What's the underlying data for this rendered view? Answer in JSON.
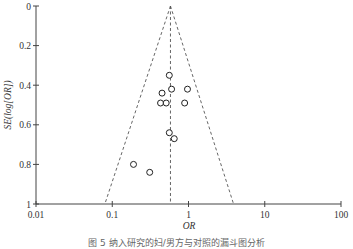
{
  "chart_data": {
    "type": "scatter",
    "subtype": "funnel_plot",
    "title": "",
    "xlabel": "OR",
    "ylabel": "SE(log[OR])",
    "x_scale": "log",
    "xlim": [
      0.01,
      100
    ],
    "ylim": [
      1,
      0
    ],
    "y_inverted": true,
    "x_ticks": [
      "0.01",
      "0.1",
      "1",
      "10",
      "100"
    ],
    "y_ticks": [
      "0",
      "0.2",
      "0.4",
      "0.6",
      "0.8",
      "1"
    ],
    "grid": false,
    "pooled_or": 0.58,
    "funnel": {
      "apex": [
        0.58,
        0
      ],
      "left_base": [
        0.08,
        1
      ],
      "right_base": [
        3.9,
        1
      ],
      "line_style": "dashed"
    },
    "points": [
      {
        "or": 0.56,
        "se": 0.35
      },
      {
        "or": 0.6,
        "se": 0.42
      },
      {
        "or": 0.45,
        "se": 0.44
      },
      {
        "or": 0.97,
        "se": 0.42
      },
      {
        "or": 0.43,
        "se": 0.49
      },
      {
        "or": 0.51,
        "se": 0.49
      },
      {
        "or": 0.89,
        "se": 0.49
      },
      {
        "or": 0.56,
        "se": 0.64
      },
      {
        "or": 0.65,
        "se": 0.67
      },
      {
        "or": 0.19,
        "se": 0.8
      },
      {
        "or": 0.31,
        "se": 0.84
      }
    ],
    "marker": "open-circle"
  },
  "caption": "图 5  纳入研究的妇/男方与对照的漏斗图分析"
}
